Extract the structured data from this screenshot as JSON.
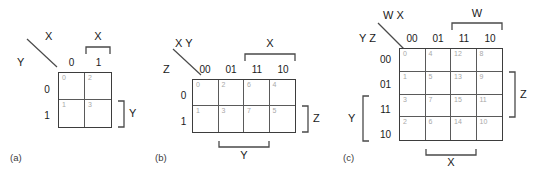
{
  "figure": {
    "background": "#ffffff",
    "line_color": "#4a4a4a",
    "cell_number_color": "#a8a8a8",
    "text_color": "#1a1a1a"
  },
  "maps": [
    {
      "id": "a",
      "caption": "(a)",
      "corner": {
        "top_label": "X",
        "bottom_label": "Y"
      },
      "col_headers": [
        "0",
        "1"
      ],
      "row_headers": [
        "0",
        "1"
      ],
      "cells": [
        [
          "0",
          "2"
        ],
        [
          "1",
          "3"
        ]
      ],
      "brackets": [
        {
          "name": "top-bracket-x",
          "label": "X",
          "side": "top"
        },
        {
          "name": "right-bracket-y",
          "label": "Y",
          "side": "right"
        }
      ]
    },
    {
      "id": "b",
      "caption": "(b)",
      "corner": {
        "top_label": "X Y",
        "bottom_label": "Z"
      },
      "col_headers": [
        "00",
        "01",
        "11",
        "10"
      ],
      "row_headers": [
        "0",
        "1"
      ],
      "cells": [
        [
          "0",
          "2",
          "6",
          "4"
        ],
        [
          "1",
          "3",
          "7",
          "5"
        ]
      ],
      "brackets": [
        {
          "name": "top-bracket-x",
          "label": "X",
          "side": "top"
        },
        {
          "name": "right-bracket-z",
          "label": "Z",
          "side": "right"
        },
        {
          "name": "bottom-bracket-y",
          "label": "Y",
          "side": "bottom"
        }
      ]
    },
    {
      "id": "c",
      "caption": "(c)",
      "corner": {
        "top_label": "W X",
        "bottom_label": "Y Z"
      },
      "col_headers": [
        "00",
        "01",
        "11",
        "10"
      ],
      "row_headers": [
        "00",
        "01",
        "11",
        "10"
      ],
      "cells": [
        [
          "0",
          "4",
          "12",
          "8"
        ],
        [
          "1",
          "5",
          "13",
          "9"
        ],
        [
          "3",
          "7",
          "15",
          "11"
        ],
        [
          "2",
          "6",
          "14",
          "10"
        ]
      ],
      "brackets": [
        {
          "name": "top-bracket-w",
          "label": "W",
          "side": "top"
        },
        {
          "name": "right-bracket-z",
          "label": "Z",
          "side": "right"
        },
        {
          "name": "left-bracket-y",
          "label": "Y",
          "side": "left"
        },
        {
          "name": "bottom-bracket-x",
          "label": "X",
          "side": "bottom"
        }
      ]
    }
  ]
}
